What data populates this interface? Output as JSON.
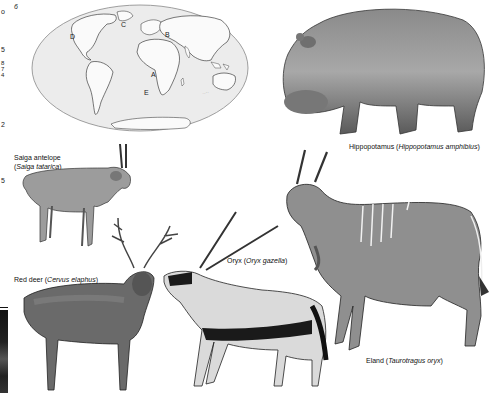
{
  "page": {
    "margin_numbers": [
      {
        "text": "o",
        "x": 1,
        "y": 8
      },
      {
        "text": "6",
        "x": 14,
        "y": 3
      },
      {
        "text": "5",
        "x": 1,
        "y": 46
      },
      {
        "text": "8",
        "x": 1,
        "y": 60
      },
      {
        "text": "7",
        "x": 1,
        "y": 66
      },
      {
        "text": "4",
        "x": 1,
        "y": 72
      },
      {
        "text": "2",
        "x": 1,
        "y": 121
      },
      {
        "text": "5",
        "x": 1,
        "y": 177
      }
    ]
  },
  "map": {
    "labels": {
      "A": "A",
      "B": "B",
      "C": "C",
      "D": "D",
      "E": "E"
    }
  },
  "animals": [
    {
      "id": "hippopotamus",
      "common": "Hippopotamus",
      "scientific": "Hippopotamus amphibius"
    },
    {
      "id": "saiga",
      "common": "Saiga antelope",
      "scientific": "Saiga tatarica"
    },
    {
      "id": "red-deer",
      "common": "Red deer",
      "scientific": "Cervus elaphus"
    },
    {
      "id": "oryx",
      "common": "Oryx",
      "scientific": "Oryx gazella"
    },
    {
      "id": "eland",
      "common": "Eland",
      "scientific": "Taurotragus oryx"
    }
  ],
  "captions": {
    "hippo_common": "Hippopotamus (",
    "hippo_sci": "Hippopotamus amphibius",
    "saiga_line1": "Saiga antelope",
    "saiga_sci": "Saiga tatarica",
    "deer_common": "Red deer (",
    "deer_sci": "Cervus elaphus",
    "oryx_common": "Oryx (",
    "oryx_sci": "Oryx gazella",
    "eland_common": "Eland (",
    "eland_sci": "Taurotragus oryx",
    "close": ")",
    "open": "("
  }
}
